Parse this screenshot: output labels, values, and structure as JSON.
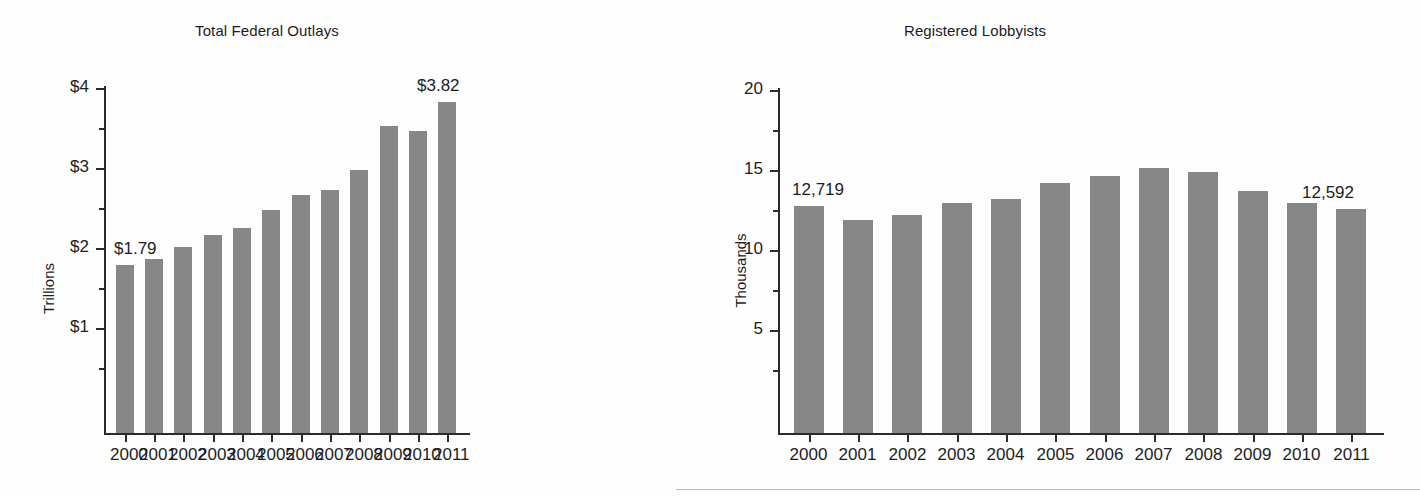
{
  "figure": {
    "background": "#fdfdfd",
    "bar_color": "#878787",
    "axis_color": "#2b2b2b"
  },
  "charts": [
    {
      "id": "total-federal-outlays",
      "title": "Total Federal Outlays",
      "ylabel": "Trillions",
      "ytick_labels": [
        "$1",
        "$2",
        "$3",
        "$4"
      ],
      "xtick_labels": [
        "2000",
        "2001",
        "2002",
        "2003",
        "2004",
        "2005",
        "2006",
        "2007",
        "2008",
        "2009",
        "2010",
        "2011"
      ],
      "first_value_label": "$1.79",
      "last_value_label": "$3.82"
    },
    {
      "id": "registered-lobbyists",
      "title": "Registered Lobbyists",
      "ylabel": "Thousands",
      "ytick_labels": [
        "5",
        "10",
        "15",
        "20"
      ],
      "xtick_labels": [
        "2000",
        "2001",
        "2002",
        "2003",
        "2004",
        "2005",
        "2006",
        "2007",
        "2008",
        "2009",
        "2010",
        "2011"
      ],
      "first_value_label": "12,719",
      "last_value_label": "12,592"
    }
  ],
  "chart_data": [
    {
      "type": "bar",
      "title": "Total Federal Outlays",
      "xlabel": "",
      "ylabel": "Trillions",
      "categories": [
        "2000",
        "2001",
        "2002",
        "2003",
        "2004",
        "2005",
        "2006",
        "2007",
        "2008",
        "2009",
        "2010",
        "2011"
      ],
      "values": [
        1.79,
        1.86,
        2.01,
        2.16,
        2.25,
        2.47,
        2.66,
        2.73,
        2.98,
        3.52,
        3.46,
        3.82
      ],
      "units": "trillions of dollars",
      "ylim": [
        0,
        4
      ],
      "yticks": [
        1,
        2,
        3,
        4
      ],
      "ytick_labels": [
        "$1",
        "$2",
        "$3",
        "$4"
      ],
      "minor_yticks": [
        0.5,
        1.5,
        2.5,
        3.5
      ],
      "grid": false,
      "legend": "none",
      "annotations": [
        {
          "category": "2000",
          "text": "$1.79",
          "position": "above-left"
        },
        {
          "category": "2011",
          "text": "$3.82",
          "position": "above"
        }
      ]
    },
    {
      "type": "bar",
      "title": "Registered Lobbyists",
      "xlabel": "",
      "ylabel": "Thousands",
      "categories": [
        "2000",
        "2001",
        "2002",
        "2003",
        "2004",
        "2005",
        "2006",
        "2007",
        "2008",
        "2009",
        "2010",
        "2011"
      ],
      "values": [
        12.719,
        11.845,
        12.182,
        12.949,
        13.216,
        14.175,
        14.598,
        15.152,
        14.848,
        13.7,
        12.928,
        12.592
      ],
      "units": "thousands of lobbyists",
      "ylim": [
        0,
        20
      ],
      "yticks": [
        5,
        10,
        15,
        20
      ],
      "ytick_labels": [
        "5",
        "10",
        "15",
        "20"
      ],
      "minor_yticks": [
        2.5,
        7.5,
        12.5,
        17.5
      ],
      "grid": false,
      "legend": "none",
      "annotations": [
        {
          "category": "2000",
          "text": "12,719",
          "position": "above-left"
        },
        {
          "category": "2011",
          "text": "12,592",
          "position": "above-right"
        }
      ]
    }
  ]
}
